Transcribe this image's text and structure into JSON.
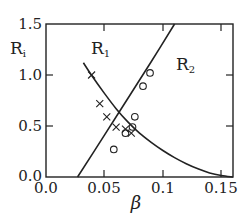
{
  "chart_data": {
    "type": "scatter",
    "title": "",
    "xlabel": "β",
    "ylabel": "R_i",
    "xlim": [
      0.0,
      0.16
    ],
    "ylim": [
      0.0,
      1.5
    ],
    "grid": false,
    "legend": null,
    "x_ticks": [
      "0.0",
      "0.05",
      "0.1",
      "0.15"
    ],
    "y_ticks": [
      "0.0",
      "0.5",
      "1.0",
      "1.5"
    ],
    "series": [
      {
        "name": "R1",
        "type": "line",
        "label": "R",
        "label_sub": "1",
        "x": [
          0.032,
          0.04,
          0.05,
          0.06,
          0.07,
          0.08,
          0.09,
          0.1,
          0.11,
          0.12,
          0.13,
          0.14,
          0.15,
          0.16
        ],
        "y": [
          1.12,
          0.98,
          0.82,
          0.67,
          0.54,
          0.43,
          0.34,
          0.26,
          0.19,
          0.13,
          0.08,
          0.04,
          0.015,
          0.0
        ]
      },
      {
        "name": "R2",
        "type": "line",
        "label": "R",
        "label_sub": "2",
        "x": [
          0.027,
          0.05,
          0.07,
          0.09,
          0.11
        ],
        "y": [
          0.0,
          0.41,
          0.77,
          1.13,
          1.5
        ]
      },
      {
        "name": "R1 data (×)",
        "type": "scatter",
        "marker": "x",
        "x": [
          0.039,
          0.046,
          0.052,
          0.06,
          0.068,
          0.073
        ],
        "y": [
          1.0,
          0.72,
          0.59,
          0.49,
          0.47,
          0.43
        ]
      },
      {
        "name": "R2 data (○)",
        "type": "scatter",
        "marker": "o",
        "x": [
          0.089,
          0.083,
          0.076,
          0.074,
          0.068,
          0.058
        ],
        "y": [
          1.02,
          0.89,
          0.59,
          0.49,
          0.43,
          0.27
        ]
      }
    ]
  },
  "labels": {
    "y_axis_main": "R",
    "y_axis_sub": "i",
    "x_axis": "β",
    "r1_main": "R",
    "r1_sub": "1",
    "r2_main": "R",
    "r2_sub": "2",
    "xt0": "0.0",
    "xt1": "0.05",
    "xt2": "0.1",
    "xt3": "0.15",
    "yt0": "0.0",
    "yt1": "0.5",
    "yt2": "1.0",
    "yt3": "1.5"
  },
  "colors": {
    "ink": "#222222",
    "background": "#ffffff"
  }
}
